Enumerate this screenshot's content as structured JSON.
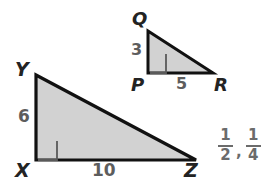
{
  "figure": {
    "type": "geometry-diagram",
    "background_color": "#ffffff",
    "stroke_color": "#111111",
    "fill_color": "#d2d2d2",
    "label_color": "#232323",
    "measure_color": "#5d5d5d",
    "answer_color": "#6b6b6b"
  },
  "triangles": [
    {
      "name": "triangle-pqr",
      "id": "small",
      "vertices": [
        {
          "label": "Q",
          "x": 148,
          "y": 31,
          "label_x": 132,
          "label_y": 10
        },
        {
          "label": "P",
          "x": 148,
          "y": 73,
          "label_x": 131,
          "label_y": 76
        },
        {
          "label": "R",
          "x": 213,
          "y": 73,
          "label_x": 214,
          "label_y": 76
        }
      ],
      "right_angle_at": "P",
      "measures": [
        {
          "side": "QP",
          "value": "3",
          "x": 131,
          "y": 42
        },
        {
          "side": "PR",
          "value": "5",
          "x": 176,
          "y": 76
        }
      ]
    },
    {
      "name": "triangle-xyz",
      "id": "large",
      "vertices": [
        {
          "label": "Y",
          "x": 36,
          "y": 75,
          "label_x": 15,
          "label_y": 60
        },
        {
          "label": "X",
          "x": 36,
          "y": 160,
          "label_x": 15,
          "label_y": 161
        },
        {
          "label": "Z",
          "x": 196,
          "y": 160,
          "label_x": 184,
          "label_y": 161
        }
      ],
      "right_angle_at": "X",
      "measures": [
        {
          "side": "YX",
          "value": "6",
          "x": 18,
          "y": 108
        },
        {
          "side": "XZ",
          "value": "10",
          "x": 92,
          "y": 162
        }
      ]
    }
  ],
  "answers": {
    "name": "fraction-answers",
    "items": [
      {
        "numerator": "1",
        "denominator": "2",
        "trailing": ","
      },
      {
        "numerator": "1",
        "denominator": "4",
        "trailing": ""
      }
    ]
  }
}
